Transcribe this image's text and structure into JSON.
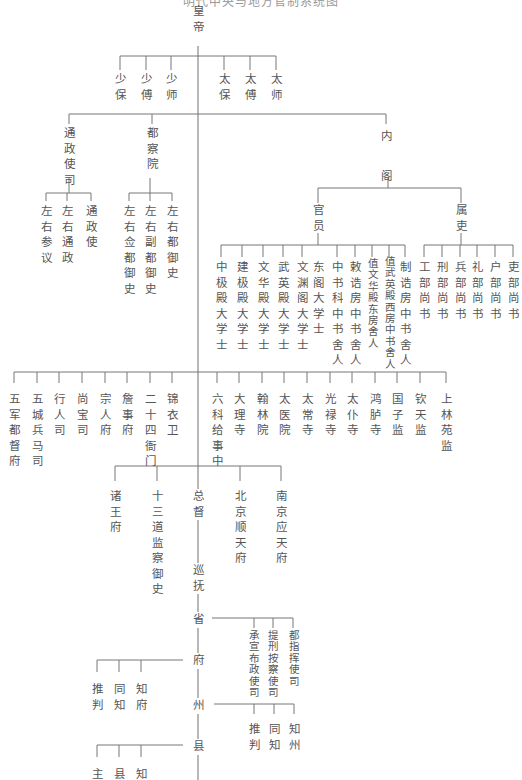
{
  "diagram": {
    "title": "明代中央与地方官制系统图",
    "root": {
      "id": "emperor",
      "label": "皇帝"
    },
    "level1": {
      "shao": [
        "少保",
        "少傅",
        "少师"
      ],
      "tai": [
        "太保",
        "太傅",
        "太师"
      ]
    },
    "level2": {
      "tongzheng": {
        "label": "通政使司",
        "children": [
          "左右参议",
          "左右通政",
          "通政使"
        ]
      },
      "duchayuan": {
        "label": "都察院",
        "children": [
          "左右佥都御史",
          "左右副都御史",
          "左右都御史"
        ]
      },
      "neige": {
        "label": "内阁",
        "guanyuan": {
          "label": "官员",
          "children": [
            "中极殿大学士",
            "建极殿大学士",
            "文华殿大学士",
            "武英殿大学士",
            "文渊阁大学士",
            "东阁大学士",
            "中书科中书舍人",
            "敕诰房中书舍人",
            "值文华殿东房舍人",
            "值武英殿西房中书舍人",
            "制诰房中书舍人"
          ]
        },
        "shuli": {
          "label": "属吏",
          "children": [
            "工部尚书",
            "刑部尚书",
            "兵部尚书",
            "礼部尚书",
            "户部尚书",
            "吏部尚书"
          ]
        }
      }
    },
    "departments_left": [
      "五军都督府",
      "五城兵马司",
      "行人司",
      "尚宝司",
      "宗人府",
      "詹事府",
      "二十四衙门",
      "锦衣卫"
    ],
    "departments_right": [
      "六科给事中",
      "大理寺",
      "翰林院",
      "太医院",
      "太常寺",
      "光禄寺",
      "太仆寺",
      "鸿胪寺",
      "国子监",
      "钦天监",
      "上林苑监"
    ],
    "local": {
      "branches": [
        "诸王府",
        "十三道监察御史",
        "总督",
        "北京顺天府",
        "南京应天府"
      ],
      "chain": [
        "巡抚",
        "省",
        "府",
        "州",
        "县"
      ],
      "province_offices": [
        "承宣布政使司",
        "提刑按察使司",
        "都指挥使司"
      ],
      "prefecture_officials": [
        "推判",
        "同知",
        "知府"
      ],
      "department_officials": [
        "推判",
        "同知",
        "知州"
      ],
      "county_officials": [
        "主",
        "县",
        "知"
      ]
    }
  }
}
